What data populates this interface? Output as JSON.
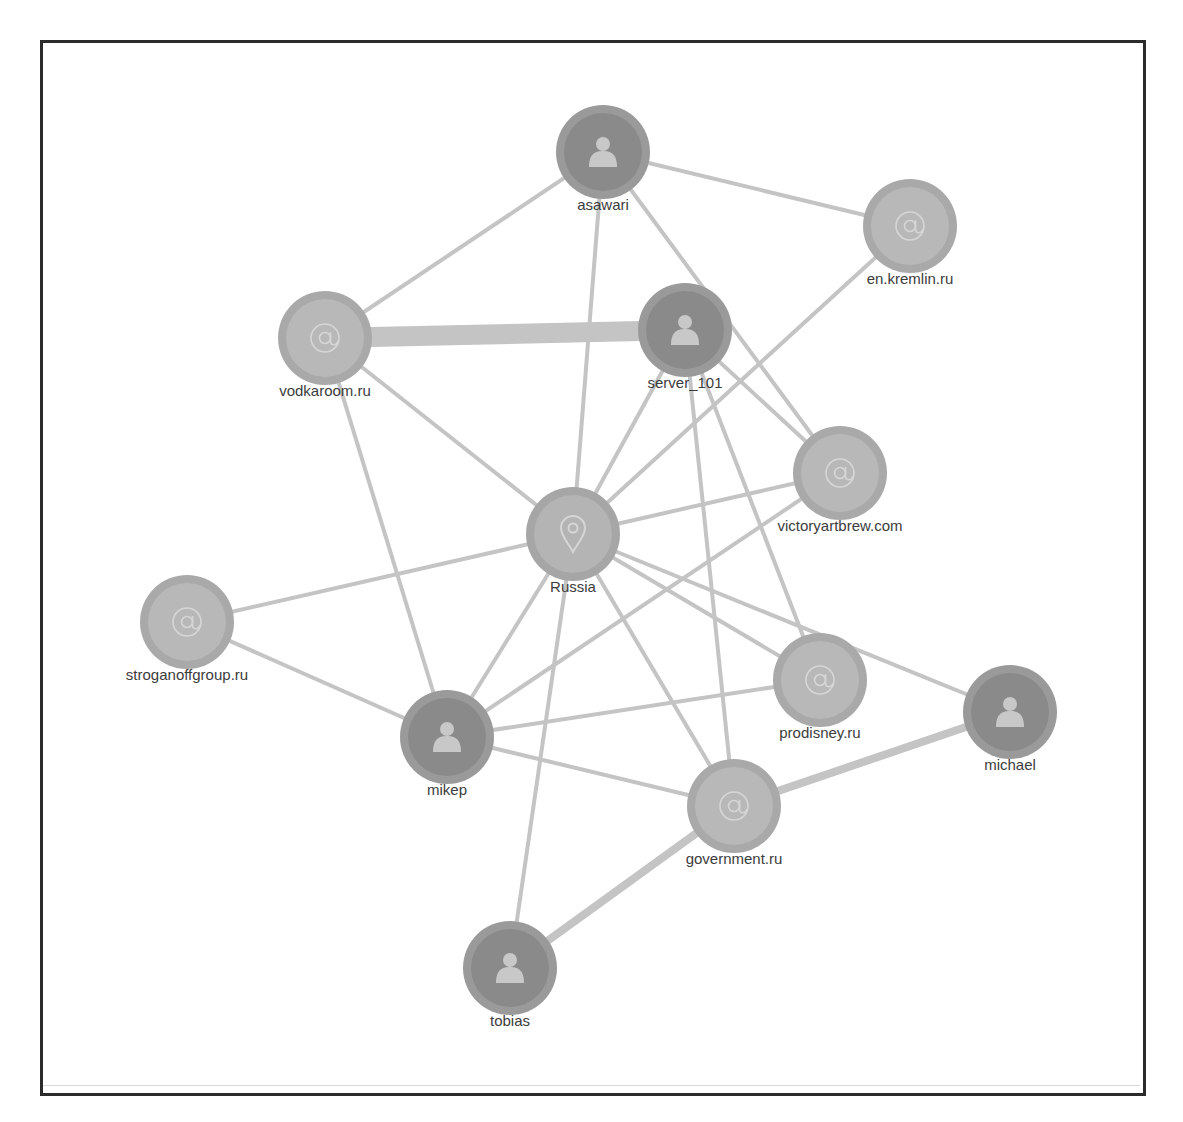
{
  "graph": {
    "title": "",
    "colors": {
      "edge": "#c4c4c4",
      "person_outer": "#9a9a9a",
      "person_inner": "#8a8a8a",
      "domain_outer": "#a9a9a9",
      "domain_inner": "#b8b8b8",
      "location_outer": "#a6a6a6",
      "location_inner": "#b4b4b4",
      "icon": "#c8c8c8",
      "frame": "#2b2b2b"
    },
    "nodes": [
      {
        "id": "asawari",
        "label": "asawari",
        "type": "person",
        "icon": "person-icon",
        "x": 603,
        "y": 152
      },
      {
        "id": "en_kremlin",
        "label": "en.kremlin.ru",
        "type": "domain",
        "icon": "at-icon",
        "x": 910,
        "y": 226
      },
      {
        "id": "vodkaroom",
        "label": "vodkaroom.ru",
        "type": "domain",
        "icon": "at-icon",
        "x": 325,
        "y": 338
      },
      {
        "id": "server_101",
        "label": "server_101",
        "type": "person",
        "icon": "person-icon",
        "x": 685,
        "y": 330
      },
      {
        "id": "victoryartbrew",
        "label": "victoryartbrew.com",
        "type": "domain",
        "icon": "at-icon",
        "x": 840,
        "y": 473
      },
      {
        "id": "russia",
        "label": "Russia",
        "type": "location",
        "icon": "map-pin-icon",
        "x": 573,
        "y": 534
      },
      {
        "id": "stroganoff",
        "label": "stroganoffgroup.ru",
        "type": "domain",
        "icon": "at-icon",
        "x": 187,
        "y": 622
      },
      {
        "id": "prodisney",
        "label": "prodisney.ru",
        "type": "domain",
        "icon": "at-icon",
        "x": 820,
        "y": 680
      },
      {
        "id": "michael",
        "label": "michael",
        "type": "person",
        "icon": "person-icon",
        "x": 1010,
        "y": 712
      },
      {
        "id": "mikep",
        "label": "mikep",
        "type": "person",
        "icon": "person-icon",
        "x": 447,
        "y": 737
      },
      {
        "id": "government",
        "label": "government.ru",
        "type": "domain",
        "icon": "at-icon",
        "x": 734,
        "y": 806
      },
      {
        "id": "tobias",
        "label": "tobias",
        "type": "person",
        "icon": "person-icon",
        "x": 510,
        "y": 968
      }
    ],
    "edges": [
      {
        "from": "asawari",
        "to": "en_kremlin",
        "weight": 4
      },
      {
        "from": "asawari",
        "to": "vodkaroom",
        "weight": 4
      },
      {
        "from": "asawari",
        "to": "russia",
        "weight": 4
      },
      {
        "from": "asawari",
        "to": "victoryartbrew",
        "weight": 4
      },
      {
        "from": "vodkaroom",
        "to": "server_101",
        "weight": 20
      },
      {
        "from": "vodkaroom",
        "to": "russia",
        "weight": 4
      },
      {
        "from": "vodkaroom",
        "to": "mikep",
        "weight": 4
      },
      {
        "from": "server_101",
        "to": "russia",
        "weight": 4
      },
      {
        "from": "server_101",
        "to": "victoryartbrew",
        "weight": 4
      },
      {
        "from": "server_101",
        "to": "government",
        "weight": 4
      },
      {
        "from": "server_101",
        "to": "prodisney",
        "weight": 4
      },
      {
        "from": "en_kremlin",
        "to": "russia",
        "weight": 4
      },
      {
        "from": "victoryartbrew",
        "to": "russia",
        "weight": 4
      },
      {
        "from": "victoryartbrew",
        "to": "mikep",
        "weight": 4
      },
      {
        "from": "russia",
        "to": "stroganoff",
        "weight": 4
      },
      {
        "from": "russia",
        "to": "mikep",
        "weight": 4
      },
      {
        "from": "russia",
        "to": "tobias",
        "weight": 4
      },
      {
        "from": "russia",
        "to": "government",
        "weight": 4
      },
      {
        "from": "russia",
        "to": "prodisney",
        "weight": 4
      },
      {
        "from": "russia",
        "to": "michael",
        "weight": 4
      },
      {
        "from": "stroganoff",
        "to": "mikep",
        "weight": 4
      },
      {
        "from": "mikep",
        "to": "prodisney",
        "weight": 4
      },
      {
        "from": "mikep",
        "to": "government",
        "weight": 4
      },
      {
        "from": "government",
        "to": "michael",
        "weight": 8
      },
      {
        "from": "government",
        "to": "tobias",
        "weight": 8
      }
    ]
  }
}
